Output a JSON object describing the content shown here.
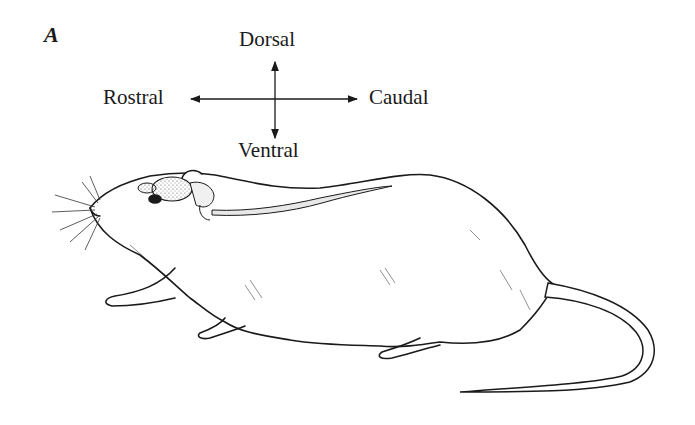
{
  "figure": {
    "panel_label": "A",
    "directions": {
      "dorsal": "Dorsal",
      "ventral": "Ventral",
      "rostral": "Rostral",
      "caudal": "Caudal"
    },
    "colors": {
      "ink": "#1a1a1a",
      "background": "#ffffff",
      "stipple": "#d0d0d0"
    }
  }
}
